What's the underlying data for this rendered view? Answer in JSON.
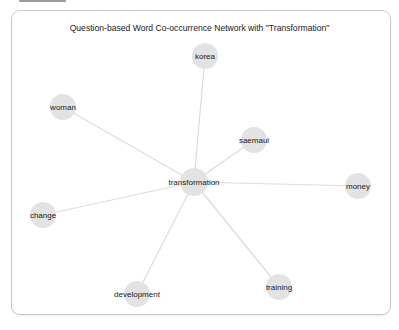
{
  "title": "Question-based Word Co-occurrence Network with \"Transformation\"",
  "colors": {
    "node_fill": "#e3e3e3",
    "edge": "#dcdcdc",
    "frame_border": "#c8c8c8",
    "label": "#1a1a1a"
  },
  "network": {
    "center": "transformation",
    "nodes": [
      {
        "id": "transformation",
        "label": "transformation",
        "x": 194,
        "y": 182,
        "r": 14
      },
      {
        "id": "korea",
        "label": "korea",
        "x": 205,
        "y": 56,
        "r": 13
      },
      {
        "id": "woman",
        "label": "woman",
        "x": 63,
        "y": 107,
        "r": 13
      },
      {
        "id": "saemaul",
        "label": "saemaul",
        "x": 254,
        "y": 140,
        "r": 13
      },
      {
        "id": "money",
        "label": "money",
        "x": 358,
        "y": 186,
        "r": 13
      },
      {
        "id": "change",
        "label": "change",
        "x": 43,
        "y": 215,
        "r": 13
      },
      {
        "id": "development",
        "label": "development",
        "x": 137,
        "y": 294,
        "r": 13
      },
      {
        "id": "training",
        "label": "training",
        "x": 279,
        "y": 287,
        "r": 13
      }
    ],
    "edges": [
      {
        "source": "transformation",
        "target": "korea"
      },
      {
        "source": "transformation",
        "target": "woman"
      },
      {
        "source": "transformation",
        "target": "saemaul"
      },
      {
        "source": "transformation",
        "target": "money"
      },
      {
        "source": "transformation",
        "target": "change"
      },
      {
        "source": "transformation",
        "target": "development"
      },
      {
        "source": "transformation",
        "target": "training"
      }
    ]
  }
}
